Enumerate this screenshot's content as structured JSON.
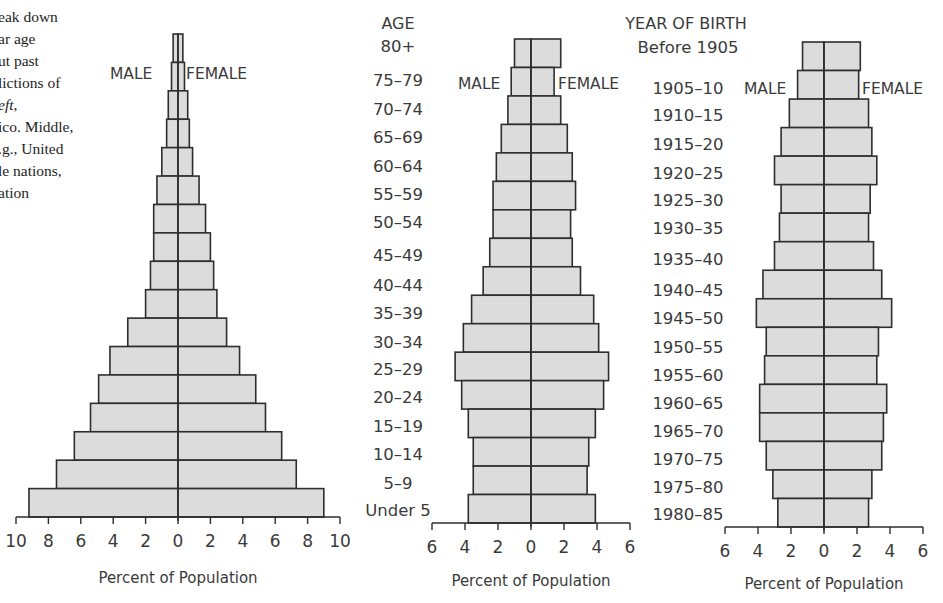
{
  "caption": {
    "lines": [
      "eak down",
      "ar age",
      "ut past",
      "lictions of",
      "eft,",
      "ico. Middle,",
      ".g., United",
      "le nations,",
      "ation"
    ]
  },
  "colors": {
    "bar_fill": "#dcdcdc",
    "bar_stroke": "#2e2e2e",
    "axis": "#2e2e2e",
    "text": "#3a3a3a"
  },
  "age_labels": {
    "header": "AGE",
    "items": [
      "80+",
      "75–79",
      "70–74",
      "65–69",
      "60–64",
      "55–59",
      "50–54",
      "45–49",
      "40–44",
      "35–39",
      "30–34",
      "25–29",
      "20–24",
      "15–19",
      "10–14",
      "5–9",
      "Under 5"
    ]
  },
  "year_labels": {
    "header": "YEAR OF BIRTH",
    "items": [
      "Before 1905",
      "1905–10",
      "1910–15",
      "1915–20",
      "1920–25",
      "1925–30",
      "1930–35",
      "1935–40",
      "1940–45",
      "1945–50",
      "1950–55",
      "1955–60",
      "1960–65",
      "1965–70",
      "1970–75",
      "1975–80",
      "1980–85"
    ]
  },
  "chart_data": [
    {
      "type": "bar",
      "subtype": "population-pyramid",
      "title": "",
      "xlabel": "Percent of Population",
      "ylabel": "AGE",
      "male_label": "MALE",
      "female_label": "FEMALE",
      "categories": [
        "80+",
        "75-79",
        "70-74",
        "65-69",
        "60-64",
        "55-59",
        "50-54",
        "45-49",
        "40-44",
        "35-39",
        "30-34",
        "25-29",
        "20-24",
        "15-19",
        "10-14",
        "5-9",
        "Under 5"
      ],
      "series": [
        {
          "name": "MALE",
          "values": [
            0.3,
            0.4,
            0.6,
            0.7,
            1.0,
            1.3,
            1.5,
            1.5,
            1.7,
            2.0,
            3.1,
            4.2,
            4.9,
            5.4,
            6.4,
            7.5,
            9.2
          ]
        },
        {
          "name": "FEMALE",
          "values": [
            0.3,
            0.4,
            0.6,
            0.7,
            0.9,
            1.3,
            1.7,
            2.0,
            2.2,
            2.4,
            3.0,
            3.8,
            4.8,
            5.4,
            6.4,
            7.3,
            9.0
          ]
        }
      ],
      "xticks": [
        10,
        8,
        6,
        4,
        2,
        0,
        2,
        4,
        6,
        8,
        10
      ],
      "xlim": [
        -10,
        10
      ],
      "grid": false,
      "layout": {
        "cx": 178,
        "unit": 16.2,
        "top": 34,
        "bottom": 517,
        "male_label_x": 110,
        "female_label_x": 186,
        "label_y": 79,
        "xlabel_y": 583
      }
    },
    {
      "type": "bar",
      "subtype": "population-pyramid",
      "title": "",
      "xlabel": "Percent of Population",
      "ylabel": "AGE",
      "male_label": "MALE",
      "female_label": "FEMALE",
      "categories": [
        "80+",
        "75-79",
        "70-74",
        "65-69",
        "60-64",
        "55-59",
        "50-54",
        "45-49",
        "40-44",
        "35-39",
        "30-34",
        "25-29",
        "20-24",
        "15-19",
        "10-14",
        "5-9",
        "Under 5"
      ],
      "series": [
        {
          "name": "MALE",
          "values": [
            1.0,
            1.2,
            1.4,
            1.8,
            2.1,
            2.3,
            2.3,
            2.5,
            2.9,
            3.6,
            4.1,
            4.6,
            4.2,
            3.8,
            3.5,
            3.5,
            3.8
          ]
        },
        {
          "name": "FEMALE",
          "values": [
            1.8,
            1.4,
            1.8,
            2.2,
            2.5,
            2.7,
            2.4,
            2.5,
            3.0,
            3.8,
            4.1,
            4.7,
            4.4,
            3.9,
            3.5,
            3.4,
            3.9
          ]
        }
      ],
      "xticks": [
        6,
        4,
        2,
        0,
        2,
        4,
        6
      ],
      "xlim": [
        -6,
        6
      ],
      "grid": false,
      "layout": {
        "cx": 531,
        "unit": 16.5,
        "top": 39,
        "bottom": 523,
        "male_label_x": 458,
        "female_label_x": 558,
        "label_y": 89,
        "xlabel_y": 586
      }
    },
    {
      "type": "bar",
      "subtype": "population-pyramid",
      "title": "",
      "xlabel": "Percent of Population",
      "ylabel": "YEAR OF BIRTH",
      "male_label": "MALE",
      "female_label": "FEMALE",
      "categories": [
        "Before 1905",
        "1905-10",
        "1910-15",
        "1915-20",
        "1920-25",
        "1925-30",
        "1930-35",
        "1935-40",
        "1940-45",
        "1945-50",
        "1950-55",
        "1955-60",
        "1960-65",
        "1965-70",
        "1970-75",
        "1975-80",
        "1980-85"
      ],
      "series": [
        {
          "name": "MALE",
          "values": [
            1.3,
            1.6,
            2.1,
            2.6,
            3.0,
            2.6,
            2.7,
            3.0,
            3.7,
            4.1,
            3.5,
            3.6,
            3.9,
            3.9,
            3.5,
            3.1,
            2.8
          ]
        },
        {
          "name": "FEMALE",
          "values": [
            2.2,
            2.1,
            2.7,
            2.9,
            3.2,
            2.8,
            2.7,
            3.0,
            3.5,
            4.1,
            3.3,
            3.2,
            3.8,
            3.6,
            3.5,
            2.9,
            2.7
          ]
        }
      ],
      "xticks": [
        6,
        4,
        2,
        0,
        2,
        4,
        6
      ],
      "xlim": [
        -6,
        6
      ],
      "grid": false,
      "layout": {
        "cx": 824,
        "unit": 16.5,
        "top": 42,
        "bottom": 527,
        "male_label_x": 744,
        "female_label_x": 862,
        "label_y": 94,
        "xlabel_y": 589
      }
    }
  ]
}
